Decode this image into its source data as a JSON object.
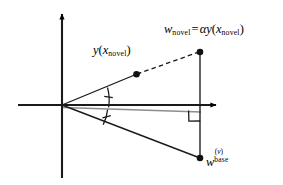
{
  "figure": {
    "type": "vector-geometry-diagram",
    "width": 283,
    "height": 185,
    "background_color": "#ffffff",
    "stroke_color": "#000000",
    "secondary_stroke_color": "#8a8a8a",
    "axes": {
      "x_axis": {
        "name": "horizontal-axis",
        "from": [
          18,
          105
        ],
        "to": [
          222,
          105
        ],
        "arrow_at": "end"
      },
      "y_axis": {
        "name": "vertical-axis",
        "from": [
          62,
          178
        ],
        "to": [
          62,
          10
        ],
        "arrow_at": "end"
      },
      "origin": [
        62,
        105
      ]
    },
    "points": [
      {
        "id": "y-xnovel-point",
        "coords": [
          136,
          74
        ],
        "label": "y(x_novel)"
      },
      {
        "id": "w-novel-point",
        "coords": [
          200,
          52
        ],
        "label": "w_novel"
      },
      {
        "id": "w-base-point",
        "coords": [
          200,
          158
        ],
        "label": "w_base^(v)"
      }
    ],
    "segments": [
      {
        "id": "upper-ray-solid",
        "from": [
          62,
          105
        ],
        "to": [
          136,
          74
        ],
        "style": "solid"
      },
      {
        "id": "upper-ray-dashed",
        "from": [
          136,
          74
        ],
        "to": [
          200,
          52
        ],
        "style": "dashed"
      },
      {
        "id": "lower-ray-solid",
        "from": [
          62,
          105
        ],
        "to": [
          200,
          158
        ],
        "style": "solid"
      },
      {
        "id": "vertical-connector",
        "from": [
          200,
          52
        ],
        "to": [
          200,
          158
        ],
        "style": "solid"
      },
      {
        "id": "bisector-gray",
        "from": [
          62,
          107
        ],
        "to": [
          201,
          112
        ],
        "style": "solid-gray"
      }
    ],
    "angle_marks": {
      "upper_arc": {
        "radius": 46,
        "ticks": 1
      },
      "lower_arc": {
        "radius": 46,
        "ticks": 1
      },
      "note": "equal angle tick marks"
    },
    "right_angle_marker": {
      "corner": [
        200,
        112
      ],
      "size": 11
    }
  },
  "labels": {
    "y_of_x_novel": {
      "var": "y",
      "open_paren": "(",
      "arg_var": "x",
      "arg_sub": "novel",
      "close_paren": ")"
    },
    "w_novel_equation": {
      "lhs_var": "w",
      "lhs_sub": "novel",
      "equals": "=",
      "alpha": "α",
      "rhs_var": "y",
      "open_paren": "(",
      "arg_var": "x",
      "arg_sub": "novel",
      "close_paren": ")"
    },
    "w_base": {
      "var": "w",
      "sup_open": "(",
      "sup_var": "v",
      "sup_close": ")",
      "sub": "base"
    }
  }
}
